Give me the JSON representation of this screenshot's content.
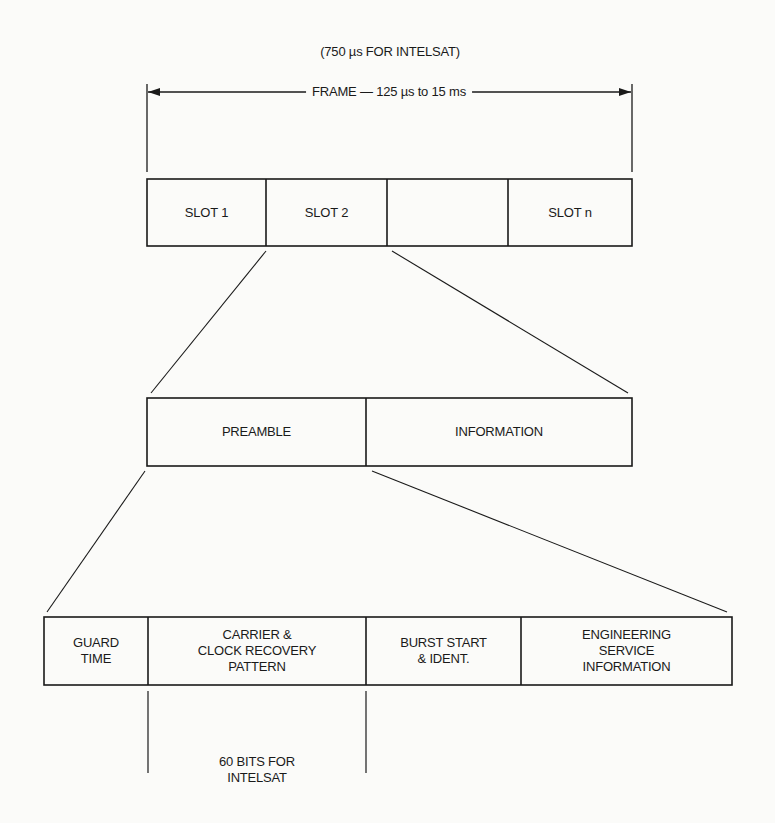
{
  "header": {
    "intelsat_note": "(750 µs FOR INTELSAT)",
    "frame_label": "FRAME — 125 µs to 15 ms"
  },
  "frame": {
    "slots": [
      {
        "label": "SLOT 1"
      },
      {
        "label": "SLOT 2"
      },
      {
        "label": ""
      },
      {
        "label": "SLOT n"
      }
    ]
  },
  "slot_detail": {
    "sections": [
      {
        "label": "PREAMBLE"
      },
      {
        "label": "INFORMATION"
      }
    ]
  },
  "preamble_detail": {
    "sections": [
      {
        "lines": [
          "GUARD",
          "TIME"
        ]
      },
      {
        "lines": [
          "CARRIER &",
          "CLOCK RECOVERY",
          "PATTERN"
        ]
      },
      {
        "lines": [
          "BURST START",
          "& IDENT."
        ]
      },
      {
        "lines": [
          "ENGINEERING",
          "SERVICE",
          "INFORMATION"
        ]
      }
    ]
  },
  "recovery_note": {
    "lines": [
      "60 BITS FOR",
      "INTELSAT"
    ]
  },
  "colors": {
    "line": "#1a1a1a",
    "background": "#fbfbf9"
  }
}
